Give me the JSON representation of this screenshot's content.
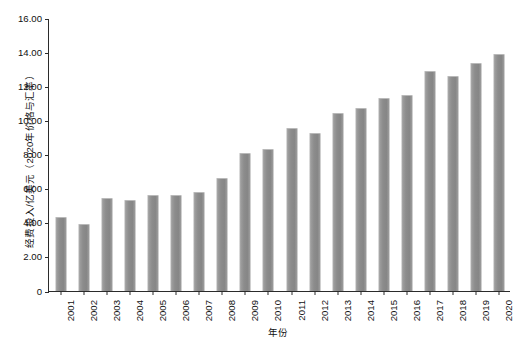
{
  "chart_data": {
    "type": "bar",
    "title": "",
    "xlabel": "年份",
    "ylabel": "经费投入/亿美元（2020年价格与汇率）",
    "categories": [
      "2001",
      "2002",
      "2003",
      "2004",
      "2005",
      "2006",
      "2007",
      "2008",
      "2009",
      "2010",
      "2011",
      "2012",
      "2013",
      "2014",
      "2015",
      "2016",
      "2017",
      "2018",
      "2019",
      "2020"
    ],
    "values": [
      4.3,
      3.85,
      5.38,
      5.25,
      5.58,
      5.55,
      5.72,
      6.55,
      8.05,
      8.28,
      9.5,
      9.22,
      10.38,
      10.68,
      11.28,
      11.45,
      12.82,
      12.52,
      13.32,
      13.85
    ],
    "ylim": [
      0,
      16
    ],
    "ytick_values": [
      0,
      2,
      4,
      6,
      8,
      10,
      12,
      14,
      16
    ],
    "ytick_labels": [
      "0",
      "2.00",
      "4.00",
      "6.00",
      "8.00",
      "10.00",
      "12.00",
      "14.00",
      "16.00"
    ],
    "grid": false,
    "legend": false,
    "series_color": "#8c8c8c",
    "axis_color": "#2b2b2b"
  }
}
